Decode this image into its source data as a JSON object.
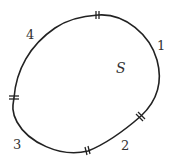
{
  "diagram": {
    "region_label": "S",
    "arc_labels": [
      {
        "id": "arc-1",
        "text": "1",
        "x": 157,
        "y": 50
      },
      {
        "id": "arc-2",
        "text": "2",
        "x": 121,
        "y": 150
      },
      {
        "id": "arc-3",
        "text": "3",
        "x": 13,
        "y": 149
      },
      {
        "id": "arc-4",
        "text": "4",
        "x": 26,
        "y": 39
      }
    ],
    "region_label_pos": {
      "x": 116,
      "y": 73
    },
    "stroke_color": "#222222",
    "tick_marks": [
      {
        "id": "tick-top",
        "x": 98,
        "y": 15
      },
      {
        "id": "tick-left",
        "x": 14,
        "y": 98
      },
      {
        "id": "tick-bottom",
        "x": 88,
        "y": 151
      },
      {
        "id": "tick-right",
        "x": 141,
        "y": 116
      }
    ]
  }
}
